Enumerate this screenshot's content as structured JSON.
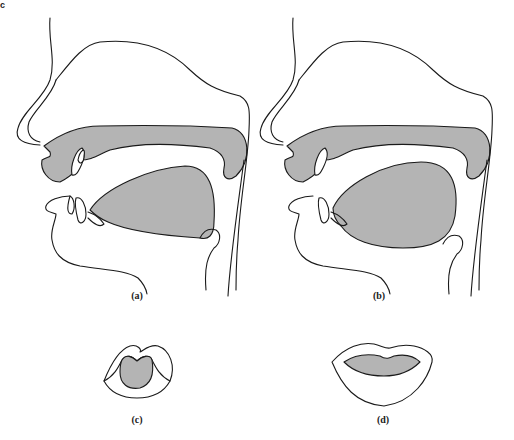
{
  "figure": {
    "corner_mark": "c",
    "colors": {
      "fill": "#b4b4b4",
      "stroke": "#1a1a1a",
      "background": "#ffffff"
    },
    "panels": [
      {
        "id": "a",
        "label": "(a)",
        "description": "Sagittal section of vocal tract, tongue retracted"
      },
      {
        "id": "b",
        "label": "(b)",
        "description": "Sagittal section of vocal tract, tongue raised"
      },
      {
        "id": "c",
        "label": "(c)",
        "description": "Front view of rounded lips"
      },
      {
        "id": "d",
        "label": "(d)",
        "description": "Front view of spread lips"
      }
    ]
  }
}
